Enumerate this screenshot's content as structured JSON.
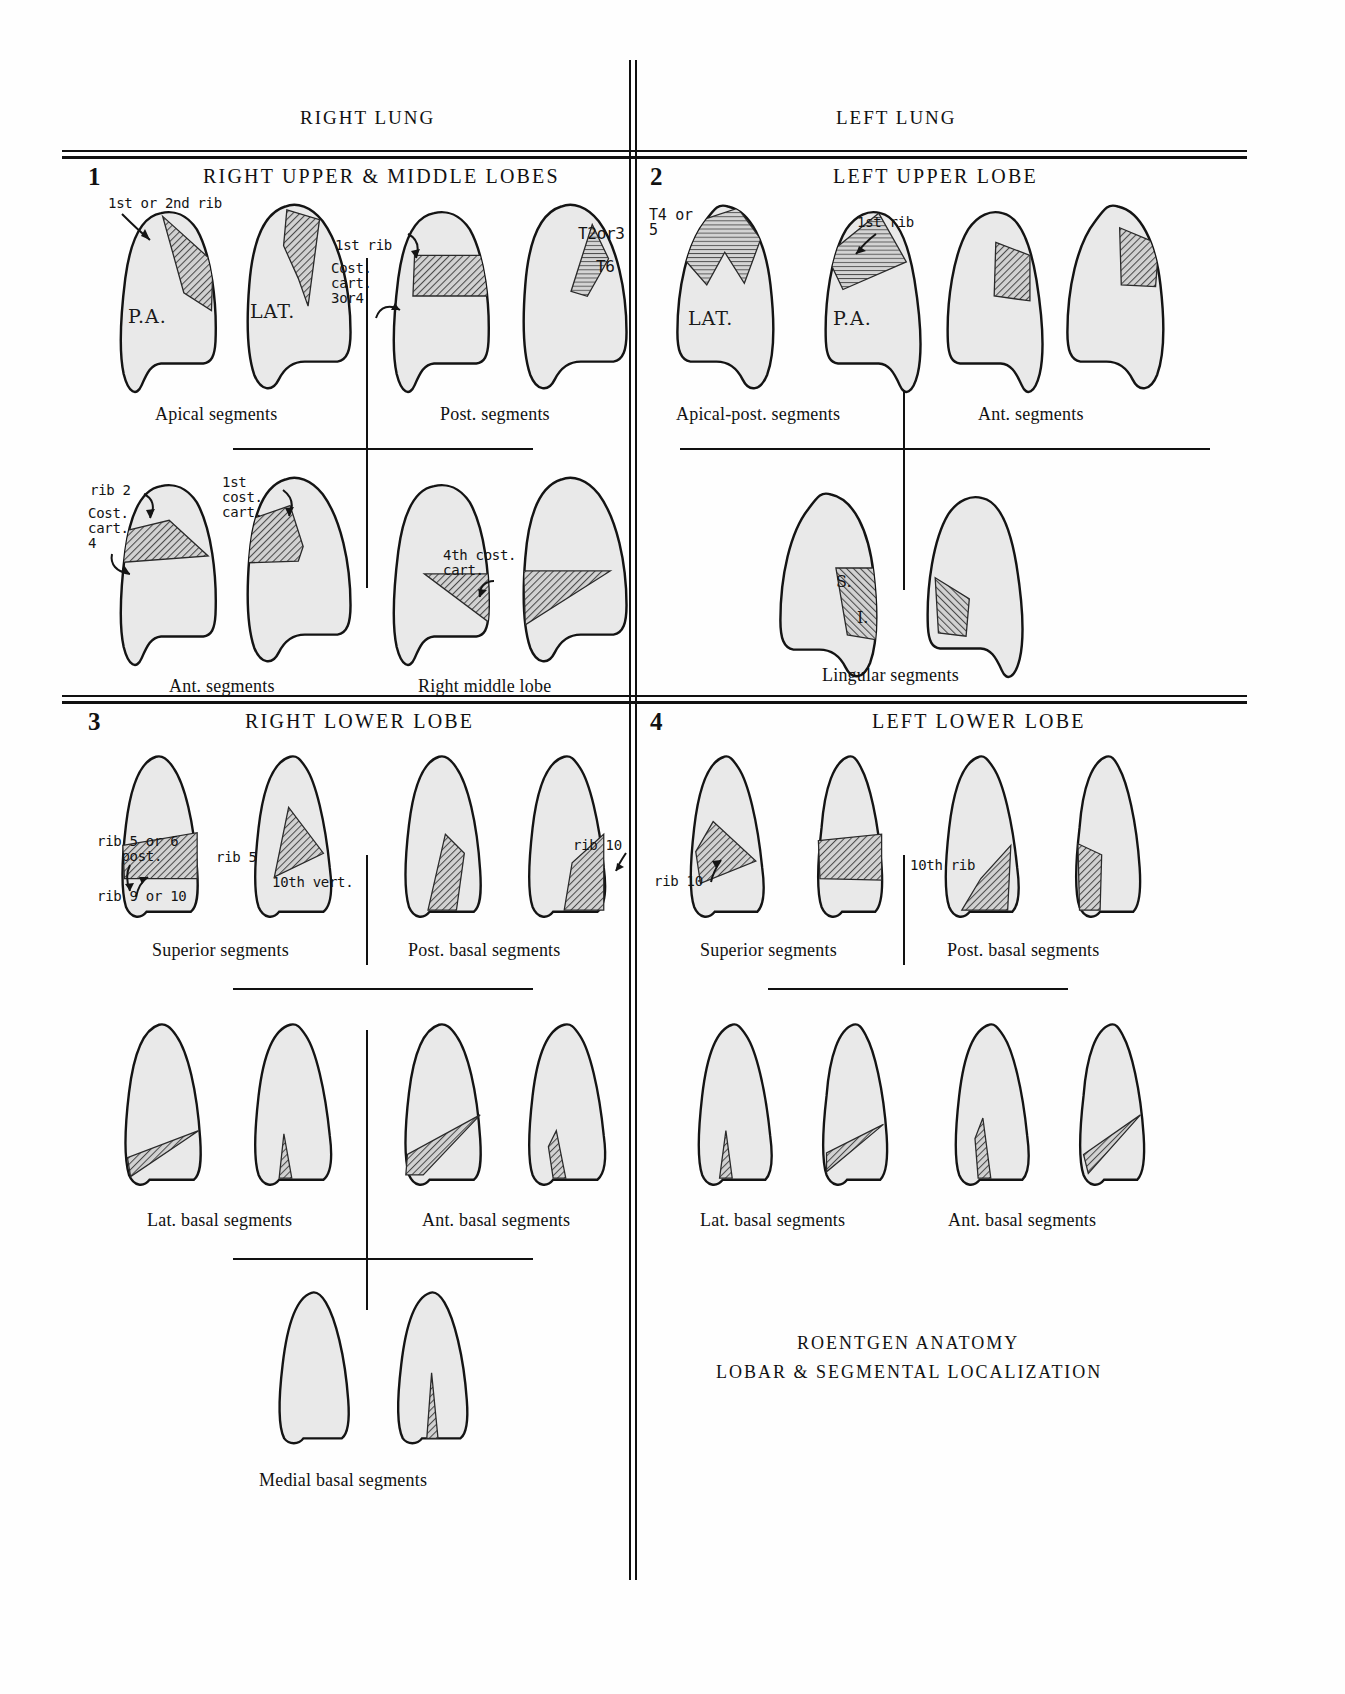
{
  "sheet": {
    "headers": {
      "right": "RIGHT LUNG",
      "left": "LEFT LUNG"
    },
    "footer": {
      "line1": "ROENTGEN ANATOMY",
      "line2": "LOBAR & SEGMENTAL LOCALIZATION"
    }
  },
  "panels": [
    {
      "number": "1",
      "title": "RIGHT UPPER & MIDDLE LOBES",
      "captions": [
        "Apical segments",
        "Post. segments",
        "Ant. segments",
        "Right middle lobe"
      ],
      "view_labels": [
        "P.A.",
        "LAT."
      ],
      "annotations": [
        "1st or 2nd rib",
        "1st rib",
        "Cost.\ncart.\n3or4",
        "T2or3",
        "T6",
        "rib 2",
        "Cost.\ncart.\n4",
        "1st\ncost.\ncart.",
        "4th cost.\ncart."
      ]
    },
    {
      "number": "2",
      "title": "LEFT UPPER LOBE",
      "captions": [
        "Apical-post. segments",
        "Ant. segments",
        "Lingular segments"
      ],
      "view_labels": [
        "LAT.",
        "P.A."
      ],
      "annotations": [
        "T4 or\n5",
        "1st rib",
        "S.",
        "I."
      ]
    },
    {
      "number": "3",
      "title": "RIGHT LOWER LOBE",
      "captions": [
        "Superior segments",
        "Post. basal segments",
        "Lat. basal segments",
        "Ant. basal segments",
        "Medial basal segments"
      ],
      "annotations": [
        "rib 5 or 6\n   post.",
        "rib 9 or 10",
        "rib 5",
        "10th vert.",
        "rib 10"
      ]
    },
    {
      "number": "4",
      "title": "LEFT LOWER LOBE",
      "captions": [
        "Superior segments",
        "Post. basal segments",
        "Lat. basal segments",
        "Ant. basal segments"
      ],
      "annotations": [
        "rib 10",
        "10th rib"
      ]
    }
  ],
  "colors": {
    "ink": "#111111",
    "lung_fill": "#e9e9e9",
    "hatch": "#6e6e6e",
    "paper": "#fefefe"
  }
}
